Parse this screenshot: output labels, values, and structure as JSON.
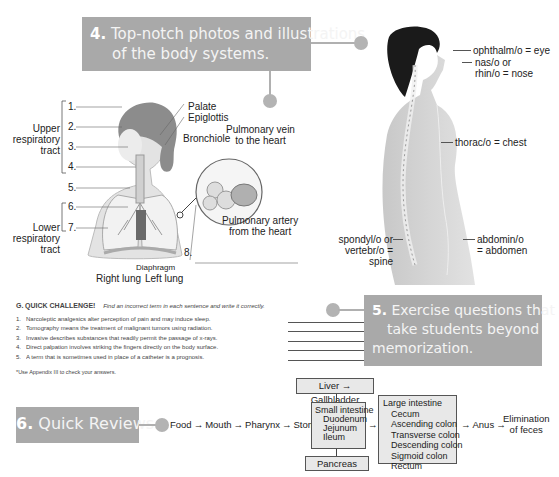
{
  "callouts": {
    "photos": {
      "number": "4.",
      "line1": "Top-notch photos and illustrations",
      "line2": "of the body systems."
    },
    "exercise": {
      "number": "5.",
      "line1": "Exercise questions that",
      "line2": "take students beyond",
      "line3": "memorization."
    },
    "reviews": {
      "number": "6.",
      "text": "Quick Reviews."
    }
  },
  "respiratory_diagram": {
    "groups": {
      "upper": "Upper\nrespiratory\ntract",
      "lower": "Lower\nrespiratory\ntract"
    },
    "numbers": [
      "1.",
      "2.",
      "3.",
      "4.",
      "5.",
      "6.",
      "7.",
      "8."
    ],
    "labels": {
      "palate": "Palate",
      "epiglottis": "Epiglottis",
      "bronchiole": "Bronchiole",
      "pulmonary_vein": "Pulmonary vein\nto the heart",
      "pulmonary_artery": "Pulmonary artery\nfrom the heart",
      "diaphragm": "Diaphragm",
      "right_lung": "Right lung",
      "left_lung": "Left lung"
    }
  },
  "body_photo": {
    "labels": {
      "eye": "ophthalm/o = eye",
      "nose": "nas/o or\nrhin/o = nose",
      "chest": "thorac/o = chest",
      "spine": "spondyl/o or\nvertebr/o =\nspine",
      "abdomen": "abdomin/o\n= abdomen"
    }
  },
  "quick_challenge": {
    "letter": "G.",
    "title": "QUICK CHALLENGE!",
    "instruction": "Find an incorrect term in each sentence and write it correctly.",
    "items": [
      {
        "n": "1.",
        "text": "Narcoleptic analgesics alter perception of pain and may induce sleep."
      },
      {
        "n": "2.",
        "text": "Tomography means the treatment of malignant tumors using radiation."
      },
      {
        "n": "3.",
        "text": "Invasive describes substances that readily permit the passage of x-rays."
      },
      {
        "n": "4.",
        "text": "Direct palpation involves striking the fingers directly on the body surface."
      },
      {
        "n": "5.",
        "text": "A term that is sometimes used in place of a catheter is a prognosis."
      }
    ],
    "footnote": "*Use Appendix III to check your answers."
  },
  "digestive_flow": {
    "steps": [
      "Food",
      "Mouth",
      "Pharynx",
      "Stomach"
    ],
    "liver": "Liver → Gallbladder",
    "small_intestine": {
      "title": "Small intestine",
      "parts": [
        "Duodenum",
        "Jejunum",
        "Ileum"
      ]
    },
    "pancreas": "Pancreas",
    "large_intestine": {
      "title": "Large intestine",
      "parts": [
        "Cecum",
        "Ascending colon",
        "Transverse colon",
        "Descending colon",
        "Sigmoid colon",
        "Rectum"
      ]
    },
    "anus": "Anus",
    "end": "Elimination\nof feces",
    "arrow": "→"
  }
}
